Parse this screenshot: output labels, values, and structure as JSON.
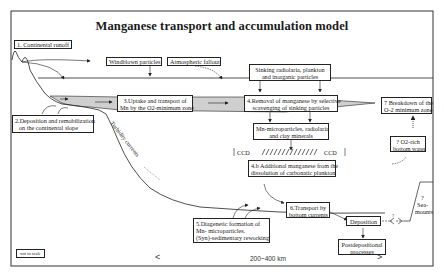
{
  "title": "Manganese transport and accumulation model",
  "boxes": {
    "b1": "1. Continental runoff",
    "windblown": "Windblown particles",
    "atmospheric": "Atmospheric fallout",
    "sinking_l1": "Sinking radiolaria, plankton",
    "sinking_l2": "and inorganic particles",
    "b3_l1": "3.Uptake and transport of",
    "b3_l2": "Mn by the O2-minimum zone",
    "b4_l1": "4.Removal of manganese by selective",
    "b4_l2": "scavenging of sinking particles",
    "b7_l1": "7 Breakdown of the",
    "b7_l2": "O-2 minimum zone",
    "b2_l1": "2.Deposition and remobilization",
    "b2_l2": "on the continental slope",
    "micro_l1": "Mn-microparticles, radiolaria",
    "micro_l2": "and clay minerals",
    "o2rich_l1": "? O2-rich",
    "o2rich_l2": "bottom water",
    "b4b_l1": "4.b Additional manganese from the",
    "b4b_l2": "dissolution of carbonatic plankton",
    "b6_l1": "6.Transport by",
    "b6_l2": "bottom currents",
    "b5_l1": "5.Diagenetic formation of",
    "b5_l2": "Mn- microparticles.",
    "b5_l3": "(Syn)-sedimentary reworking",
    "deposition": "Deposition",
    "postdep_l1": "Postdepositional",
    "postdep_l2": "processes",
    "not_to_scale": "not to scale"
  },
  "labels": {
    "turbidity": "Turbidity currents",
    "ccd_left": "CCD",
    "ccd_right": "CCD",
    "seamounts_q": "?",
    "seamounts_l1": "Sea-",
    "seamounts_l2": "mounts",
    "deposition_q": "?"
  },
  "scale": {
    "left_bracket": "<",
    "distance": "200~400 km",
    "right_bracket": ">"
  },
  "colors": {
    "line": "#222222",
    "o2_zone_fill": "#cfcfcf",
    "frame": "#333333"
  }
}
